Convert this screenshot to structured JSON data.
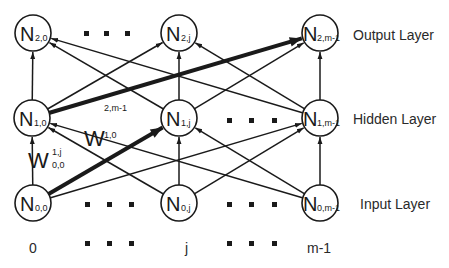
{
  "diagram": {
    "title": "",
    "layers": [
      {
        "id": "input",
        "label": "Input Layer",
        "row": 0,
        "y": 203,
        "nodes": [
          {
            "id": "N_0_0",
            "sub": "0,0",
            "x": 33
          },
          {
            "id": "N_0_j",
            "sub": "0,j",
            "x": 179
          },
          {
            "id": "N_0_m1",
            "sub": "0,m-1",
            "x": 320
          }
        ]
      },
      {
        "id": "hidden",
        "label": "Hidden Layer",
        "row": 1,
        "y": 118,
        "nodes": [
          {
            "id": "N_1_0",
            "sub": "1,0",
            "x": 32
          },
          {
            "id": "N_1_j",
            "sub": "1,j",
            "x": 179
          },
          {
            "id": "N_1_m1",
            "sub": "1,m-1",
            "x": 320
          }
        ]
      },
      {
        "id": "output",
        "label": "Output Layer",
        "row": 2,
        "y": 33,
        "nodes": [
          {
            "id": "N_2_0",
            "sub": "2,0",
            "x": 33
          },
          {
            "id": "N_2_j",
            "sub": "2,j",
            "x": 179
          },
          {
            "id": "N_2_m1",
            "sub": "2,m-1",
            "x": 320
          }
        ]
      }
    ],
    "node_symbol": "N",
    "node_radius": 18,
    "connectivity": "fully-connected between adjacent layers, arrows pointing upward",
    "highlighted_edges": [
      {
        "from": "N_1_0",
        "to": "N_2_m1",
        "weight_label": {
          "main": "W",
          "sup": "2,m-1",
          "sub": "1,0"
        }
      },
      {
        "from": "N_0_0",
        "to": "N_1_j",
        "weight_label": {
          "main": "W",
          "sup": "1,j",
          "sub": "0,0"
        }
      }
    ],
    "ellipsis": "■ ■ ■",
    "column_indices": [
      "0",
      "j",
      "m-1"
    ],
    "layer_labels": {
      "output": "Output Layer",
      "hidden": "Hidden Layer",
      "input": "Input Layer"
    },
    "weights": {
      "w1": {
        "main": "W",
        "sup": "2,m-1",
        "sub": "1,0"
      },
      "w2": {
        "main": "W",
        "sup": "1,j",
        "sub": "0,0"
      }
    },
    "nodes": {
      "n20": {
        "sym": "N",
        "sub": "2,0"
      },
      "n2j": {
        "sym": "N",
        "sub": "2,j"
      },
      "n2m": {
        "sym": "N",
        "sub": "2,m-1"
      },
      "n10": {
        "sym": "N",
        "sub": "1,0"
      },
      "n1j": {
        "sym": "N",
        "sub": "1,j"
      },
      "n1m": {
        "sym": "N",
        "sub": "1,m-1"
      },
      "n00": {
        "sym": "N",
        "sub": "0,0"
      },
      "n0j": {
        "sym": "N",
        "sub": "0,j"
      },
      "n0m": {
        "sym": "N",
        "sub": "0,m-1"
      }
    },
    "indices": {
      "i0": "0",
      "ij": "j",
      "im": "m-1"
    },
    "colors": {
      "stroke": "#1a1a1a",
      "background": "#ffffff",
      "text": "#2a2a2a"
    }
  }
}
